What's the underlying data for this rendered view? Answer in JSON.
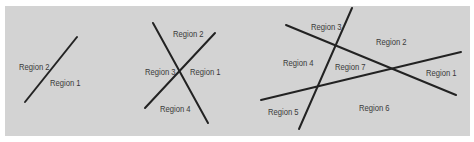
{
  "colors": {
    "background": "#ffffff",
    "panel": "#d3d3d3",
    "line": "#222222",
    "label": "#3a3a3a"
  },
  "diagrams": [
    {
      "name": "one-line",
      "lines": [
        {
          "x1": 25,
          "y1": 102,
          "x2": 77,
          "y2": 37
        }
      ],
      "labels": [
        {
          "text": "Region 2",
          "x": 19,
          "y": 62
        },
        {
          "text": "Region 1",
          "x": 50,
          "y": 78
        }
      ]
    },
    {
      "name": "two-lines",
      "lines": [
        {
          "x1": 153,
          "y1": 23,
          "x2": 208,
          "y2": 123
        },
        {
          "x1": 145,
          "y1": 108,
          "x2": 215,
          "y2": 33
        }
      ],
      "labels": [
        {
          "text": "Region 2",
          "x": 173,
          "y": 29
        },
        {
          "text": "Region 3",
          "x": 145,
          "y": 67
        },
        {
          "text": "Region 1",
          "x": 190,
          "y": 67
        },
        {
          "text": "Region 4",
          "x": 160,
          "y": 104
        }
      ]
    },
    {
      "name": "three-lines",
      "lines": [
        {
          "x1": 352,
          "y1": 8,
          "x2": 299,
          "y2": 129
        },
        {
          "x1": 286,
          "y1": 25,
          "x2": 456,
          "y2": 95
        },
        {
          "x1": 261,
          "y1": 100,
          "x2": 461,
          "y2": 52
        }
      ],
      "labels": [
        {
          "text": "Region 3",
          "x": 311,
          "y": 22
        },
        {
          "text": "Region 2",
          "x": 376,
          "y": 37
        },
        {
          "text": "Region 4",
          "x": 283,
          "y": 58
        },
        {
          "text": "Region 7",
          "x": 335,
          "y": 62
        },
        {
          "text": "Region 1",
          "x": 426,
          "y": 68
        },
        {
          "text": "Region 5",
          "x": 268,
          "y": 107
        },
        {
          "text": "Region 6",
          "x": 359,
          "y": 103
        }
      ]
    }
  ]
}
